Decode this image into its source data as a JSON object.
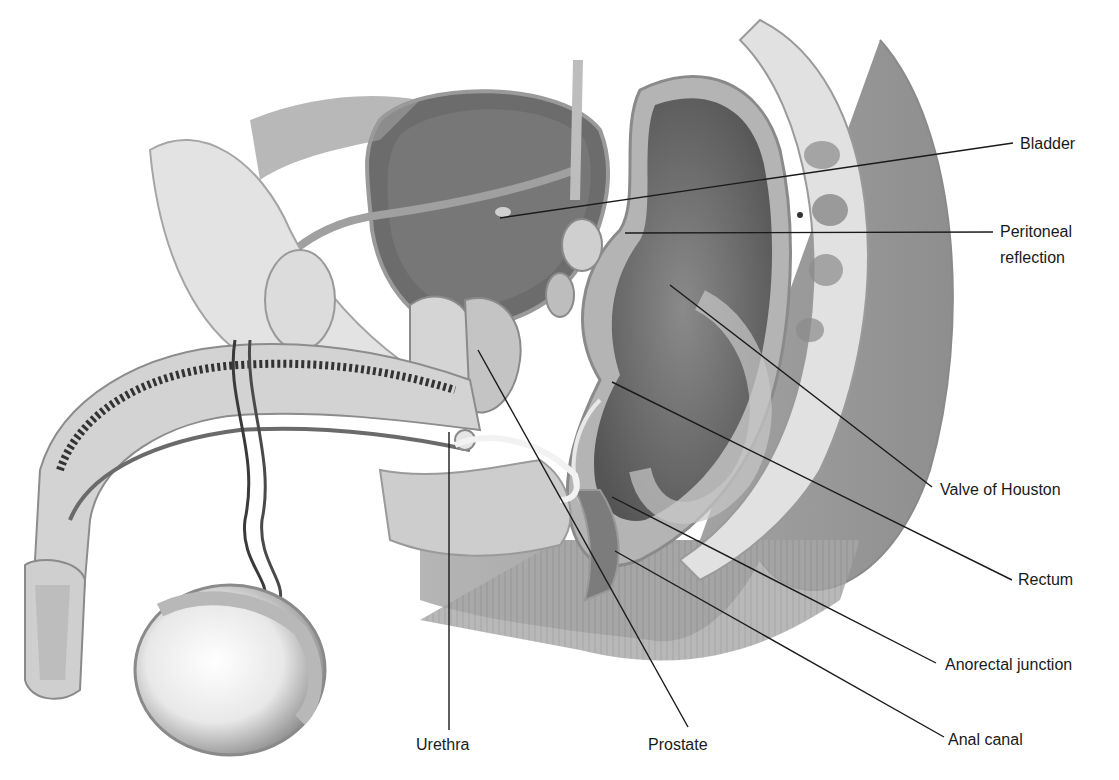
{
  "figure": {
    "type": "anatomical-illustration",
    "colors": {
      "background": "#ffffff",
      "leader_line": "#1a1a1a",
      "label_text": "#1a1a1a",
      "buttock_gray": "#9a9a9a",
      "tissue_dark": "#5e5e5e",
      "tissue_mid": "#8a8a8a",
      "tissue_light": "#d6d6d6"
    },
    "labels": [
      {
        "id": "bladder",
        "text": "Bladder",
        "anchor": [
          500,
          218
        ],
        "end": [
          1013,
          143
        ],
        "text_pos": [
          1020,
          131
        ]
      },
      {
        "id": "peritoneal-reflection",
        "text": "Peritoneal",
        "text2": "reflection",
        "anchor": [
          625,
          233
        ],
        "end": [
          993,
          232
        ],
        "text_pos": [
          1000,
          219
        ]
      },
      {
        "id": "valve-of-houston",
        "text": "Valve of Houston",
        "anchor": [
          670,
          285
        ],
        "end": [
          932,
          487
        ],
        "text_pos": [
          940,
          477
        ]
      },
      {
        "id": "rectum",
        "text": "Rectum",
        "anchor": [
          612,
          382
        ],
        "end": [
          1012,
          580
        ],
        "text_pos": [
          1018,
          567
        ]
      },
      {
        "id": "anorectal-junction",
        "text": "Anorectal junction",
        "anchor": [
          612,
          497
        ],
        "end": [
          936,
          663
        ],
        "text_pos": [
          945,
          652
        ]
      },
      {
        "id": "anal-canal",
        "text": "Anal canal",
        "anchor": [
          615,
          551
        ],
        "end": [
          944,
          737
        ],
        "text_pos": [
          948,
          727
        ]
      },
      {
        "id": "prostate",
        "text": "Prostate",
        "anchor": [
          478,
          350
        ],
        "end": [
          688,
          727
        ],
        "text_pos": [
          648,
          732
        ]
      },
      {
        "id": "urethra",
        "text": "Urethra",
        "anchor": [
          449,
          432
        ],
        "end": [
          449,
          730
        ],
        "text_pos": [
          416,
          732
        ]
      }
    ]
  }
}
